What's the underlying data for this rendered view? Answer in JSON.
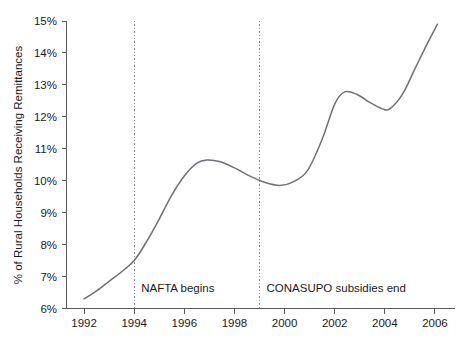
{
  "chart_data": {
    "type": "line",
    "title": "",
    "xlabel": "",
    "ylabel": "% of Rural Households Receiving Remittances",
    "xlim": [
      1991.3,
      2006.8
    ],
    "ylim": [
      6,
      15
    ],
    "grid": false,
    "legend": "none",
    "xticks": [
      "1992",
      "1994",
      "1996",
      "1998",
      "2000",
      "2002",
      "2004",
      "2006"
    ],
    "xtick_values": [
      1992,
      1994,
      1996,
      1998,
      2000,
      2002,
      2004,
      2006
    ],
    "yticks": [
      "6%",
      "7%",
      "8%",
      "9%",
      "10%",
      "11%",
      "12%",
      "13%",
      "14%",
      "15%"
    ],
    "ytick_values": [
      6,
      7,
      8,
      9,
      10,
      11,
      12,
      13,
      14,
      15
    ],
    "series": [
      {
        "name": "% of Rural Households Receiving Remittances",
        "color": "#6f6f78",
        "x": [
          1992.0,
          1992.5,
          1993.0,
          1993.5,
          1994.0,
          1994.5,
          1995.0,
          1995.5,
          1996.0,
          1996.5,
          1996.9,
          1997.4,
          1998.0,
          1998.6,
          1999.2,
          1999.8,
          2000.3,
          2000.9,
          2001.5,
          2002.0,
          2002.4,
          2002.9,
          2003.4,
          2003.9,
          2004.2,
          2004.7,
          2005.2,
          2005.7,
          2006.1
        ],
        "y": [
          6.3,
          6.55,
          6.85,
          7.15,
          7.5,
          8.1,
          8.8,
          9.55,
          10.15,
          10.55,
          10.65,
          10.6,
          10.4,
          10.15,
          9.95,
          9.85,
          9.95,
          10.3,
          11.3,
          12.4,
          12.78,
          12.7,
          12.45,
          12.25,
          12.25,
          12.7,
          13.5,
          14.3,
          14.9
        ]
      }
    ],
    "annotations": [
      {
        "label": "NAFTA begins",
        "x": 1994.0,
        "line_color": "#8a8a8a",
        "style": "dotted-vertical"
      },
      {
        "label": "CONASUPO subsidies end",
        "x": 1999.0,
        "line_color": "#8a8a8a",
        "style": "dotted-vertical"
      }
    ]
  }
}
